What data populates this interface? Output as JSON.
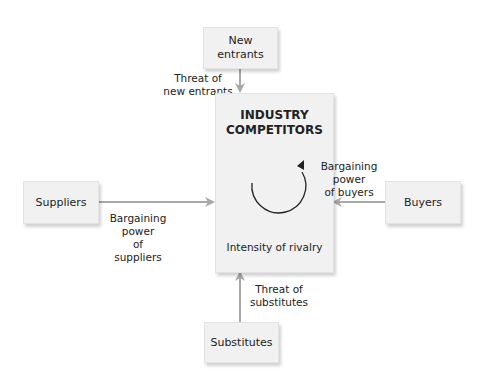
{
  "diagram": {
    "center": {
      "title_line1": "INDUSTRY",
      "title_line2": "COMPETITORS",
      "subtitle": "Intensity of rivalry",
      "icon": "circular-arrow-icon"
    },
    "nodes": {
      "top": {
        "line1": "New",
        "line2": "entrants"
      },
      "left": {
        "label": "Suppliers"
      },
      "right": {
        "label": "Buyers"
      },
      "bottom": {
        "label": "Substitutes"
      }
    },
    "edges": {
      "top": {
        "line1": "Threat of",
        "line2": "new entrants"
      },
      "left": {
        "line1": "Bargaining",
        "line2": "power",
        "line3": "of suppliers"
      },
      "right": {
        "line1": "Bargaining",
        "line2": "power",
        "line3": "of buyers"
      },
      "bottom": {
        "line1": "Threat of",
        "line2": "substitutes"
      }
    },
    "colors": {
      "box_fill": "#f1f1f1",
      "arrow": "#a8a8a8",
      "text": "#222222"
    }
  }
}
